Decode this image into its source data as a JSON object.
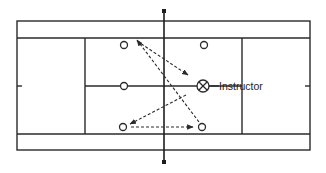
{
  "diagram": {
    "type": "tennis-court-drill",
    "labels": {
      "instructor": "Instructor"
    },
    "colors": {
      "line": "#2a2a2a",
      "background": "#ffffff"
    },
    "court": {
      "outer": {
        "x1": 17,
        "y1": 21,
        "x2": 310,
        "y2": 150
      },
      "singles_top_y": 38,
      "singles_bottom_y": 134,
      "service_line_left_x": 85,
      "service_line_right_x": 242,
      "center_service_y": 86,
      "net_x": 164
    },
    "players": [
      {
        "id": "p1",
        "x": 124,
        "y": 45
      },
      {
        "id": "p2",
        "x": 204,
        "y": 45
      },
      {
        "id": "p3",
        "x": 124,
        "y": 86
      },
      {
        "id": "p4",
        "x": 123,
        "y": 127
      },
      {
        "id": "p5",
        "x": 202,
        "y": 127
      }
    ],
    "instructor": {
      "x": 203,
      "y": 86,
      "marker": "circle-x"
    },
    "paths": [
      {
        "from": "p1-corner",
        "to": "instructor-area",
        "style": "dashed-arrow"
      },
      {
        "from": "p5",
        "to": "p1-corner",
        "style": "dashed-arrow"
      },
      {
        "from": "instructor-area",
        "to": "p4",
        "style": "dashed-arrow"
      },
      {
        "from": "p4",
        "to": "p5",
        "style": "dashed-arrow"
      }
    ]
  }
}
